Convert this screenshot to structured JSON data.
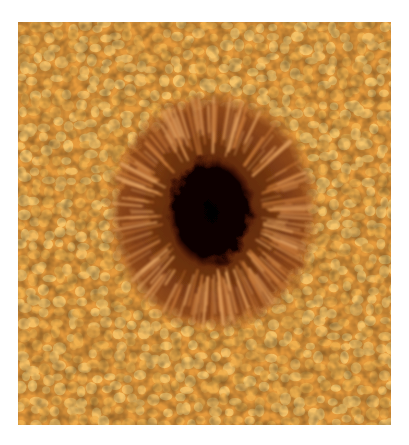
{
  "image": {
    "subject": "Sunspot with surrounding solar granulation",
    "alt": "Close-up photograph of a sunspot: a dark central umbra surrounded by a filamentary brown penumbra, set in a field of bright orange granulation cells",
    "colors": {
      "background": "#ffffff",
      "granule_light": "#f6c46a",
      "granule_mid": "#e59a3c",
      "lane_dark": "#b86a24",
      "penumbra": "#7a3812",
      "penumbra_filament": "#c77a3a",
      "umbra": "#0a0200"
    },
    "features": [
      "granulation",
      "penumbra",
      "umbra"
    ]
  }
}
